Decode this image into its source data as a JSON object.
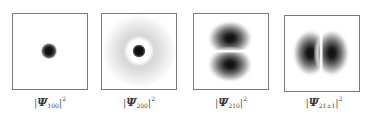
{
  "figure": {
    "panels": [
      {
        "id": "psi-100",
        "symbol": "Ψ",
        "subscript": "100",
        "superscript": "2",
        "bar_left": "|",
        "bar_right": "|",
        "shape": "single central dark spot"
      },
      {
        "id": "psi-200",
        "symbol": "Ψ",
        "subscript": "200",
        "superscript": "2",
        "bar_left": "|",
        "bar_right": "|",
        "shape": "central dark spot with white node ring and faint outer halo"
      },
      {
        "id": "psi-210",
        "symbol": "Ψ",
        "subscript": "210",
        "superscript": "2",
        "bar_left": "|",
        "bar_right": "|",
        "shape": "two lobes stacked vertically"
      },
      {
        "id": "psi-21pm1",
        "symbol": "Ψ",
        "subscript": "21±1",
        "superscript": "2",
        "bar_left": "|",
        "bar_right": "|",
        "shape": "two lobes side by side horizontally"
      }
    ],
    "colors": {
      "border": "#7a7a7a",
      "density_dark": "#111111",
      "background": "#ffffff"
    }
  }
}
